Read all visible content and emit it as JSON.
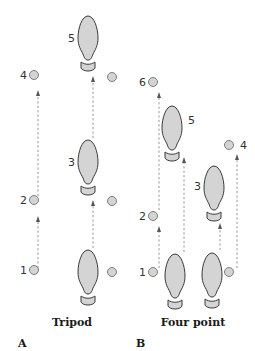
{
  "diagram": {
    "colors": {
      "foot_fill": "#d4d4d4",
      "foot_stroke": "#3a3a3a",
      "crutch_fill": "#d4d4d4",
      "crutch_stroke": "#707070",
      "path_stroke": "#8a8a8a",
      "text": "#1a1a1a"
    },
    "panels": [
      {
        "id": "A",
        "panel_label": "A",
        "caption": "Tripod",
        "step_labels": {
          "s1": "1",
          "s2": "2",
          "s3": "3",
          "s4": "4",
          "s5": "5"
        }
      },
      {
        "id": "B",
        "panel_label": "B",
        "caption": "Four point",
        "step_labels": {
          "s1": "1",
          "s2": "2",
          "s3": "3",
          "s4": "4",
          "s5": "5",
          "s6": "6"
        }
      }
    ]
  }
}
